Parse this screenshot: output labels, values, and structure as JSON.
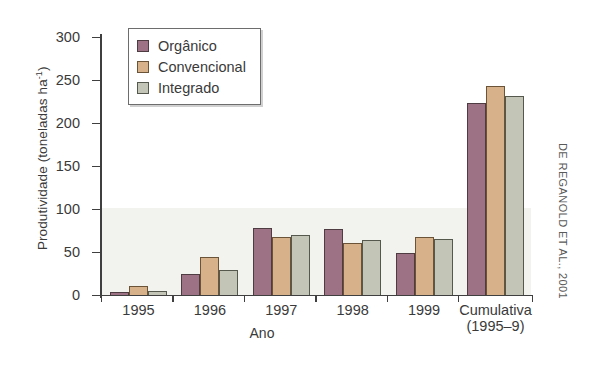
{
  "chart_data": {
    "type": "bar",
    "title": "",
    "xlabel": "Ano",
    "ylabel": "Produtividade (toneladas ha",
    "ylabel_exponent": "-1",
    "ylabel_suffix": ")",
    "categories": [
      "1995",
      "1996",
      "1997",
      "1998",
      "1999",
      "Cumulativa"
    ],
    "category_sublabels": [
      "",
      "",
      "",
      "",
      "",
      "(1995–9)"
    ],
    "series": [
      {
        "name": "Orgânico",
        "color": "#9d7285",
        "values": [
          3,
          25,
          78,
          77,
          49,
          223
        ]
      },
      {
        "name": "Convencional",
        "color": "#d6b189",
        "values": [
          10,
          44,
          67,
          61,
          68,
          243
        ]
      },
      {
        "name": "Integrado",
        "color": "#c3c6b6",
        "values": [
          5,
          29,
          70,
          64,
          65,
          231
        ]
      }
    ],
    "ylim": [
      0,
      300
    ],
    "yticks": [
      0,
      50,
      100,
      150,
      200,
      250,
      300
    ],
    "grid": false,
    "legend_position": "top-left"
  },
  "credit": "DE REGANOLD ET AL., 2001"
}
